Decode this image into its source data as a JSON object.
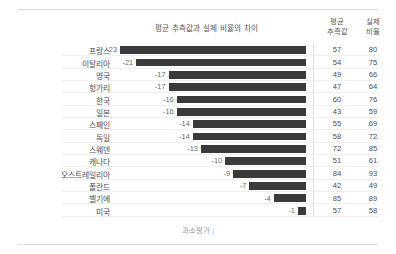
{
  "header": {
    "chart_title": "평균 추측값과 실제 비율의 차이",
    "col_est_line1": "평균",
    "col_est_line2": "추측값",
    "col_act_line1": "실제",
    "col_act_line2": "비율"
  },
  "footer": {
    "axis_note": "과소평가",
    "tick": "|"
  },
  "colors": {
    "bar": "#3a3a3a",
    "label_text": "#4d4d4f",
    "muted_text": "#6b6b6d",
    "rule": "#d9d9d9",
    "row_separator": "#efefef",
    "vertical_divider": "#dcdcdc",
    "background": "#ffffff"
  },
  "chart_data": {
    "type": "bar",
    "orientation": "horizontal",
    "title": "평균 추측값과 실제 비율의 차이",
    "xlabel": "",
    "ylabel": "",
    "xlim": [
      -24,
      0
    ],
    "grid": false,
    "legend": null,
    "annotations": [
      "과소평가"
    ],
    "categories": [
      "프랑스",
      "이탈리아",
      "영국",
      "헝가리",
      "한국",
      "일본",
      "스페인",
      "독일",
      "스웨덴",
      "캐나다",
      "오스트레일리아",
      "폴란드",
      "벨기에",
      "미국"
    ],
    "values": [
      -23,
      -21,
      -17,
      -17,
      -16,
      -16,
      -14,
      -14,
      -13,
      -10,
      -9,
      -7,
      -4,
      -1
    ],
    "series": [
      {
        "name": "평균 추측값과 실제 비율의 차이",
        "values": [
          -23,
          -21,
          -17,
          -17,
          -16,
          -16,
          -14,
          -14,
          -13,
          -10,
          -9,
          -7,
          -4,
          -1
        ]
      },
      {
        "name": "평균 추측값",
        "values": [
          57,
          54,
          49,
          47,
          60,
          43,
          55,
          58,
          72,
          51,
          84,
          42,
          85,
          57
        ]
      },
      {
        "name": "실제 비율",
        "values": [
          80,
          75,
          66,
          64,
          76,
          59,
          69,
          72,
          85,
          61,
          93,
          49,
          89,
          58
        ]
      }
    ]
  },
  "rows": [
    {
      "country": "프랑스",
      "diff": "-23",
      "est": "57",
      "act": "80"
    },
    {
      "country": "이탈리아",
      "diff": "-21",
      "est": "54",
      "act": "75"
    },
    {
      "country": "영국",
      "diff": "-17",
      "est": "49",
      "act": "66"
    },
    {
      "country": "헝가리",
      "diff": "-17",
      "est": "47",
      "act": "64"
    },
    {
      "country": "한국",
      "diff": "-16",
      "est": "60",
      "act": "76"
    },
    {
      "country": "일본",
      "diff": "-16",
      "est": "43",
      "act": "59"
    },
    {
      "country": "스페인",
      "diff": "-14",
      "est": "55",
      "act": "69"
    },
    {
      "country": "독일",
      "diff": "-14",
      "est": "58",
      "act": "72"
    },
    {
      "country": "스웨덴",
      "diff": "-13",
      "est": "72",
      "act": "85"
    },
    {
      "country": "캐나다",
      "diff": "-10",
      "est": "51",
      "act": "61"
    },
    {
      "country": "오스트레일리아",
      "diff": "-9",
      "est": "84",
      "act": "93"
    },
    {
      "country": "폴란드",
      "diff": "-7",
      "est": "42",
      "act": "49"
    },
    {
      "country": "벨기에",
      "diff": "-4",
      "est": "85",
      "act": "89"
    },
    {
      "country": "미국",
      "diff": "-1",
      "est": "57",
      "act": "58"
    }
  ]
}
